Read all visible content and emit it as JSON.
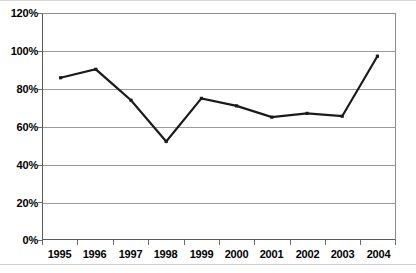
{
  "chart_data": {
    "type": "line",
    "title": "",
    "subtitle": "",
    "xlabel": "",
    "ylabel": "",
    "categories": [
      "1995",
      "1996",
      "1997",
      "1998",
      "1999",
      "2000",
      "2001",
      "2002",
      "2003",
      "2004"
    ],
    "values": [
      86,
      90.5,
      74,
      52,
      75,
      71,
      65,
      67,
      65.5,
      97.5
    ],
    "series": [
      {
        "name": "",
        "values": [
          86,
          90.5,
          74,
          52,
          75,
          71,
          65,
          67,
          65.5,
          97.5
        ]
      }
    ],
    "ylim": [
      0,
      120
    ],
    "ytick_labels": [
      "0%",
      "20%",
      "40%",
      "60%",
      "80%",
      "100%",
      "120%"
    ],
    "ytick_values": [
      0,
      20,
      40,
      60,
      80,
      100,
      120
    ],
    "grid": true,
    "grid_axis": "y",
    "legend": false,
    "legend_position": "none",
    "marker": "square",
    "line_color": "#1a1a1a",
    "grid_color": "#9a9a9a",
    "axis_color": "#5a5a5a",
    "plot_background": "#ffffff",
    "annotations": []
  }
}
